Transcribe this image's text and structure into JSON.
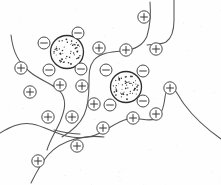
{
  "figure": {
    "background_color": "#fefefe",
    "width": 221,
    "height": 185,
    "line_color": "#545454",
    "particle_outline_color": "#2e2e2e",
    "ion_outline_color": "#4a4a4a",
    "positive_symbol": "+",
    "negative_symbol": "−"
  },
  "chart_data": {
    "type": "diagram",
    "xlabel": "",
    "ylabel": "",
    "grid": false,
    "legend": "none",
    "xlim": [
      0,
      221
    ],
    "ylim": [
      0,
      185
    ],
    "particles": [
      {
        "name": "colloid-particle-left",
        "cx": 67,
        "cy": 52,
        "r": 16.5,
        "texture": "stipple",
        "surface_charge": "negative",
        "dot_count": 58
      },
      {
        "name": "colloid-particle-right",
        "cx": 126,
        "cy": 87,
        "r": 15.5,
        "texture": "stipple",
        "surface_charge": "negative",
        "dot_count": 54
      }
    ],
    "negative_ions": [
      {
        "cx": 44,
        "cy": 43,
        "r": 6.0,
        "sign": "−"
      },
      {
        "cx": 78,
        "cy": 33,
        "r": 6.0,
        "sign": "−"
      },
      {
        "cx": 49,
        "cy": 70,
        "r": 6.0,
        "sign": "−"
      },
      {
        "cx": 81,
        "cy": 69,
        "r": 6.0,
        "sign": "−"
      },
      {
        "cx": 106,
        "cy": 70,
        "r": 6.0,
        "sign": "−"
      },
      {
        "cx": 143,
        "cy": 71,
        "r": 6.0,
        "sign": "−"
      },
      {
        "cx": 110,
        "cy": 105,
        "r": 6.0,
        "sign": "−"
      },
      {
        "cx": 143,
        "cy": 101,
        "r": 6.0,
        "sign": "−"
      }
    ],
    "positive_ions": [
      {
        "cx": 144,
        "cy": 17,
        "r": 6.2,
        "sign": "+"
      },
      {
        "cx": 99,
        "cy": 48,
        "r": 6.2,
        "sign": "+"
      },
      {
        "cx": 126,
        "cy": 50,
        "r": 6.2,
        "sign": "+"
      },
      {
        "cx": 156,
        "cy": 49,
        "r": 6.2,
        "sign": "+"
      },
      {
        "cx": 21,
        "cy": 68,
        "r": 6.2,
        "sign": "+"
      },
      {
        "cx": 30,
        "cy": 92,
        "r": 6.2,
        "sign": "+"
      },
      {
        "cx": 60,
        "cy": 85,
        "r": 6.2,
        "sign": "+"
      },
      {
        "cx": 82,
        "cy": 86,
        "r": 6.2,
        "sign": "+"
      },
      {
        "cx": 170,
        "cy": 88,
        "r": 6.2,
        "sign": "+"
      },
      {
        "cx": 94,
        "cy": 104,
        "r": 6.2,
        "sign": "+"
      },
      {
        "cx": 48,
        "cy": 117,
        "r": 6.2,
        "sign": "+"
      },
      {
        "cx": 72,
        "cy": 117,
        "r": 6.2,
        "sign": "+"
      },
      {
        "cx": 133,
        "cy": 118,
        "r": 6.2,
        "sign": "+"
      },
      {
        "cx": 156,
        "cy": 114,
        "r": 6.2,
        "sign": "+"
      },
      {
        "cx": 103,
        "cy": 128,
        "r": 6.2,
        "sign": "+"
      },
      {
        "cx": 77,
        "cy": 146,
        "r": 6.2,
        "sign": "+"
      },
      {
        "cx": 38,
        "cy": 161,
        "r": 6.2,
        "sign": "+"
      }
    ],
    "chains": [
      {
        "name": "chain-left-upper",
        "path": "M 11,35 C 13,52 18,62 30,72 C 42,82 56,84 62,94 C 67,103 64,112 60,122 C 56,131 50,140 47,150"
      },
      {
        "name": "chain-top-right",
        "path": "M 150,2 C 151,14 150,26 147,36 C 143,46 134,50 122,51 C 110,52 100,53 94,60 C 89,66 89,74 89,84 C 89,96 88,106 84,115 C 80,124 72,131 62,137"
      },
      {
        "name": "chain-right-upper",
        "path": "M 147,45 C 153,44 160,45 166,42 C 172,38 174,30 174,20 C 174,12 174,6 174,0"
      },
      {
        "name": "chain-bottom",
        "path": "M 0,133 C 10,127 20,122 32,124 C 44,126 54,133 66,136 C 78,139 90,138 100,133 C 110,128 118,121 128,119 C 138,117 148,122 155,119 C 162,116 164,106 165,97 C 166,90 168,87 172,88 C 176,89 178,96 184,104 C 192,115 204,127 221,139"
      },
      {
        "name": "chain-lower-tail",
        "path": "M 31,183 C 36,173 41,163 48,155 C 55,147 64,142 75,139 C 86,136 96,136 104,137"
      },
      {
        "name": "chain-mid-stub",
        "path": "M 54,130 C 62,132 70,134 80,134"
      }
    ]
  }
}
